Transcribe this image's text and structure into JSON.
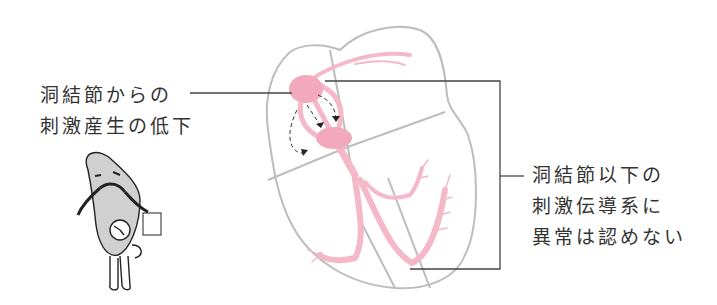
{
  "diagram": {
    "left_annotation": {
      "lines": [
        "洞結節からの",
        "刺激産生の低下"
      ]
    },
    "right_annotation": {
      "lines": [
        "洞結節以下の",
        "刺激伝導系に",
        "異常は認めない"
      ]
    },
    "colors": {
      "conduction_pink": "#f4b8c8",
      "node_pink": "#f2a9bd",
      "heart_outline": "#b8b8b8",
      "leader_line": "#444444",
      "arrow_dashed": "#333333"
    },
    "elements": {
      "sinus_node": "sinus-node",
      "av_node": "av-node",
      "character": "catfish-mascot-with-clock"
    }
  }
}
